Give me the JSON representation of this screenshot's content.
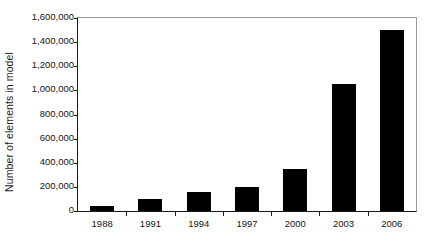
{
  "chart_data": {
    "type": "bar",
    "title": "",
    "xlabel": "",
    "ylabel": "Number of elements in model",
    "categories": [
      "1988",
      "1991",
      "1994",
      "1997",
      "2000",
      "2003",
      "2006"
    ],
    "values": [
      40000,
      100000,
      160000,
      200000,
      350000,
      1050000,
      1500000
    ],
    "ylim": [
      0,
      1600000
    ],
    "ytick_values": [
      0,
      200000,
      400000,
      600000,
      800000,
      1000000,
      1200000,
      1400000,
      1600000
    ],
    "ytick_labels": [
      "0",
      "200,000",
      "400,000",
      "600,000",
      "800,000",
      "1,000,000",
      "1,200,000",
      "1,400,000",
      "1,600,000"
    ],
    "grid": false,
    "legend": null,
    "legend_position": "none",
    "bar_color": "#000000",
    "axis_color": "#1a1a1a",
    "frame_color": "#9a9a9a",
    "background_color": "#ffffff"
  }
}
